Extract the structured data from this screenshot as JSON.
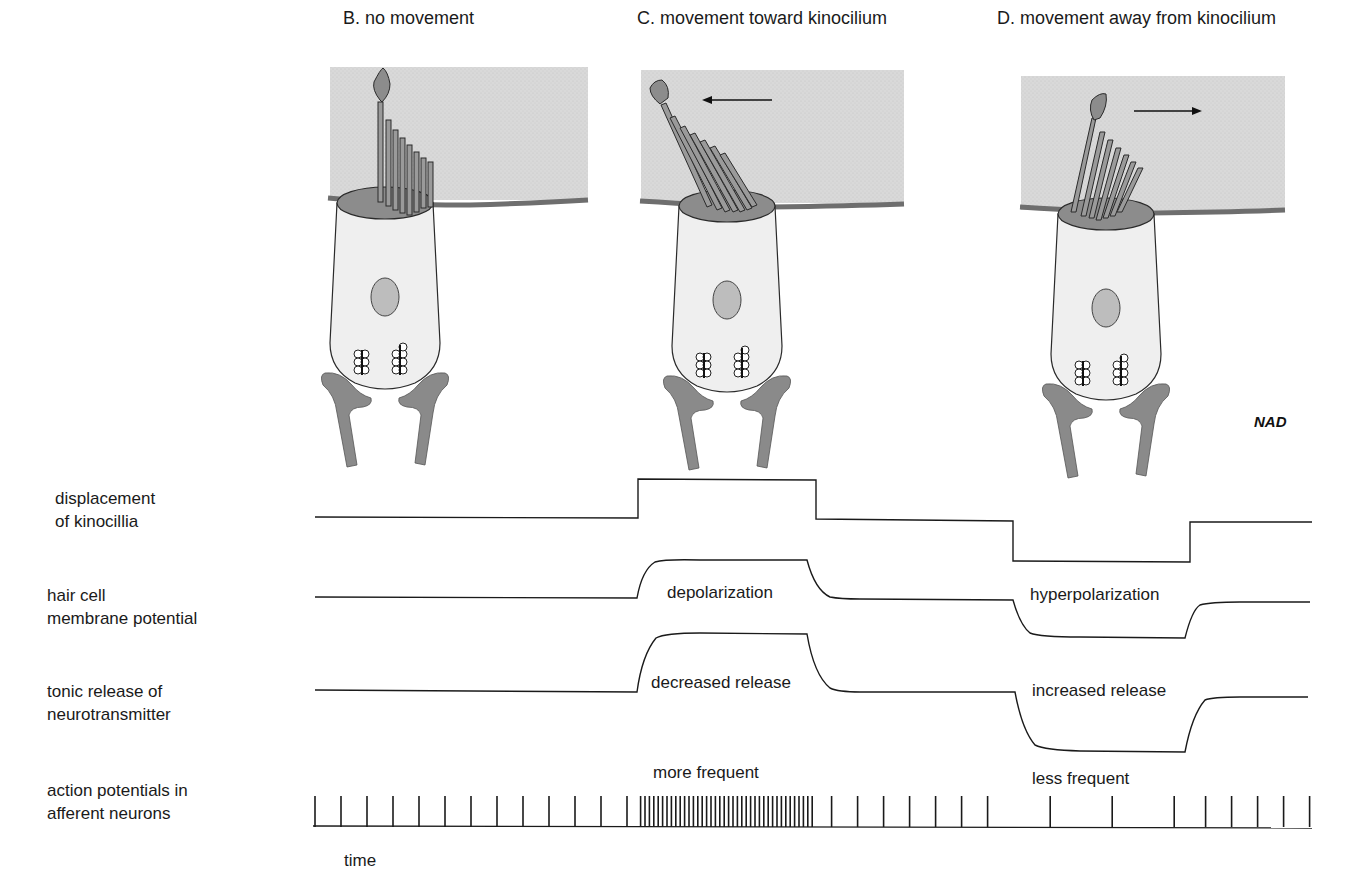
{
  "panels": [
    {
      "id": "B",
      "title": "B. no movement",
      "arrow": "none"
    },
    {
      "id": "C",
      "title": "C. movement toward kinocilium",
      "arrow": "left"
    },
    {
      "id": "D",
      "title": "D. movement away from kinocilium",
      "arrow": "right"
    }
  ],
  "signature": "NAD",
  "rows": [
    {
      "label": "displacement\nof kinocillia"
    },
    {
      "label": "hair cell\nmembrane potential"
    },
    {
      "label": "tonic release of\nneurotransmitter"
    },
    {
      "label": "action potentials in\nafferent neurons"
    }
  ],
  "trace_annotations": {
    "depolarization": "depolarization",
    "hyperpolarization": "hyperpolarization",
    "decreased_release": "decreased release",
    "increased_release": "increased release",
    "more_frequent": "more frequent",
    "less_frequent": "less frequent"
  },
  "time_label": "time",
  "colors": {
    "endolymph_gel": "#d6d6d6",
    "membrane_line": "#6e6e6e",
    "cell_body": "#efefef",
    "cell_outline": "#2a2a2a",
    "stereocilia_fill": "#8c8c8c",
    "nucleus": "#bdbdbd",
    "afferent": "#8a8a8a",
    "trace": "#1a1a1a"
  },
  "chart_data": {
    "type": "line",
    "xlabel": "time",
    "x_phases": [
      "no movement",
      "toward kinocilium",
      "rest",
      "away from kinocilium",
      "rest"
    ],
    "phase_boundaries_px": [
      315,
      638,
      816,
      1013,
      1190,
      1312
    ],
    "series": [
      {
        "name": "displacement of kinocillia",
        "levels": [
          0,
          1,
          0,
          -1,
          0
        ]
      },
      {
        "name": "hair cell membrane potential",
        "levels": [
          0,
          1,
          0,
          -1,
          0
        ],
        "annotations": [
          "depolarization",
          "hyperpolarization"
        ]
      },
      {
        "name": "tonic release of neurotransmitter",
        "levels": [
          0,
          1,
          0,
          -1,
          0
        ],
        "annotations": [
          "decreased release",
          "increased release"
        ]
      },
      {
        "name": "action potentials in afferent neurons",
        "spike_intervals_px": [
          26,
          4.4,
          26,
          62,
          26
        ],
        "annotations": [
          "more frequent",
          "less frequent"
        ]
      }
    ],
    "grid": false,
    "legend": "none"
  }
}
